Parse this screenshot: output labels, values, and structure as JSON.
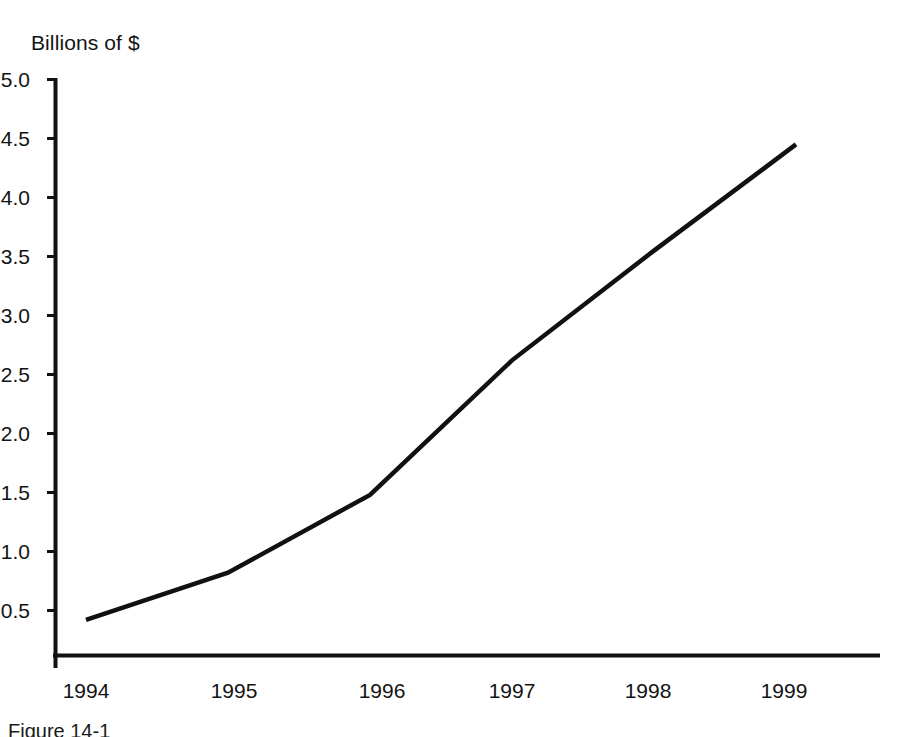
{
  "figure": {
    "axis_title": "Billions of $",
    "caption": "Figure 14-1",
    "line_color": "#111111",
    "axis_color": "#111111",
    "background": "#ffffff"
  },
  "chart_data": {
    "type": "line",
    "title": "",
    "subtitle": "",
    "xlabel": "",
    "ylabel": "Billions of $",
    "x": [
      1994,
      1995,
      1996,
      1997,
      1998,
      1999
    ],
    "values": [
      0.42,
      0.82,
      1.48,
      2.62,
      3.55,
      4.45
    ],
    "categories": [
      "1994",
      "1995",
      "1996",
      "1997",
      "1998",
      "1999"
    ],
    "series": [
      {
        "name": "Billions of $",
        "values": [
          0.42,
          0.82,
          1.48,
          2.62,
          3.55,
          4.45
        ]
      }
    ],
    "xlim": [
      1994,
      1999
    ],
    "ylim": [
      0,
      5.0
    ],
    "ytick_labels": [
      "5.0",
      "4.5",
      "4.0",
      "3.5",
      "3.0",
      "2.5",
      "2.0",
      "1.5",
      "1.0",
      "0.5"
    ],
    "ytick_values": [
      5.0,
      4.5,
      4.0,
      3.5,
      3.0,
      2.5,
      2.0,
      1.5,
      1.0,
      0.5
    ],
    "xtick_labels": [
      "1994",
      "1995",
      "1996",
      "1997",
      "1998",
      "1999"
    ],
    "grid": false,
    "legend": "none",
    "markers": false,
    "annotations": []
  }
}
